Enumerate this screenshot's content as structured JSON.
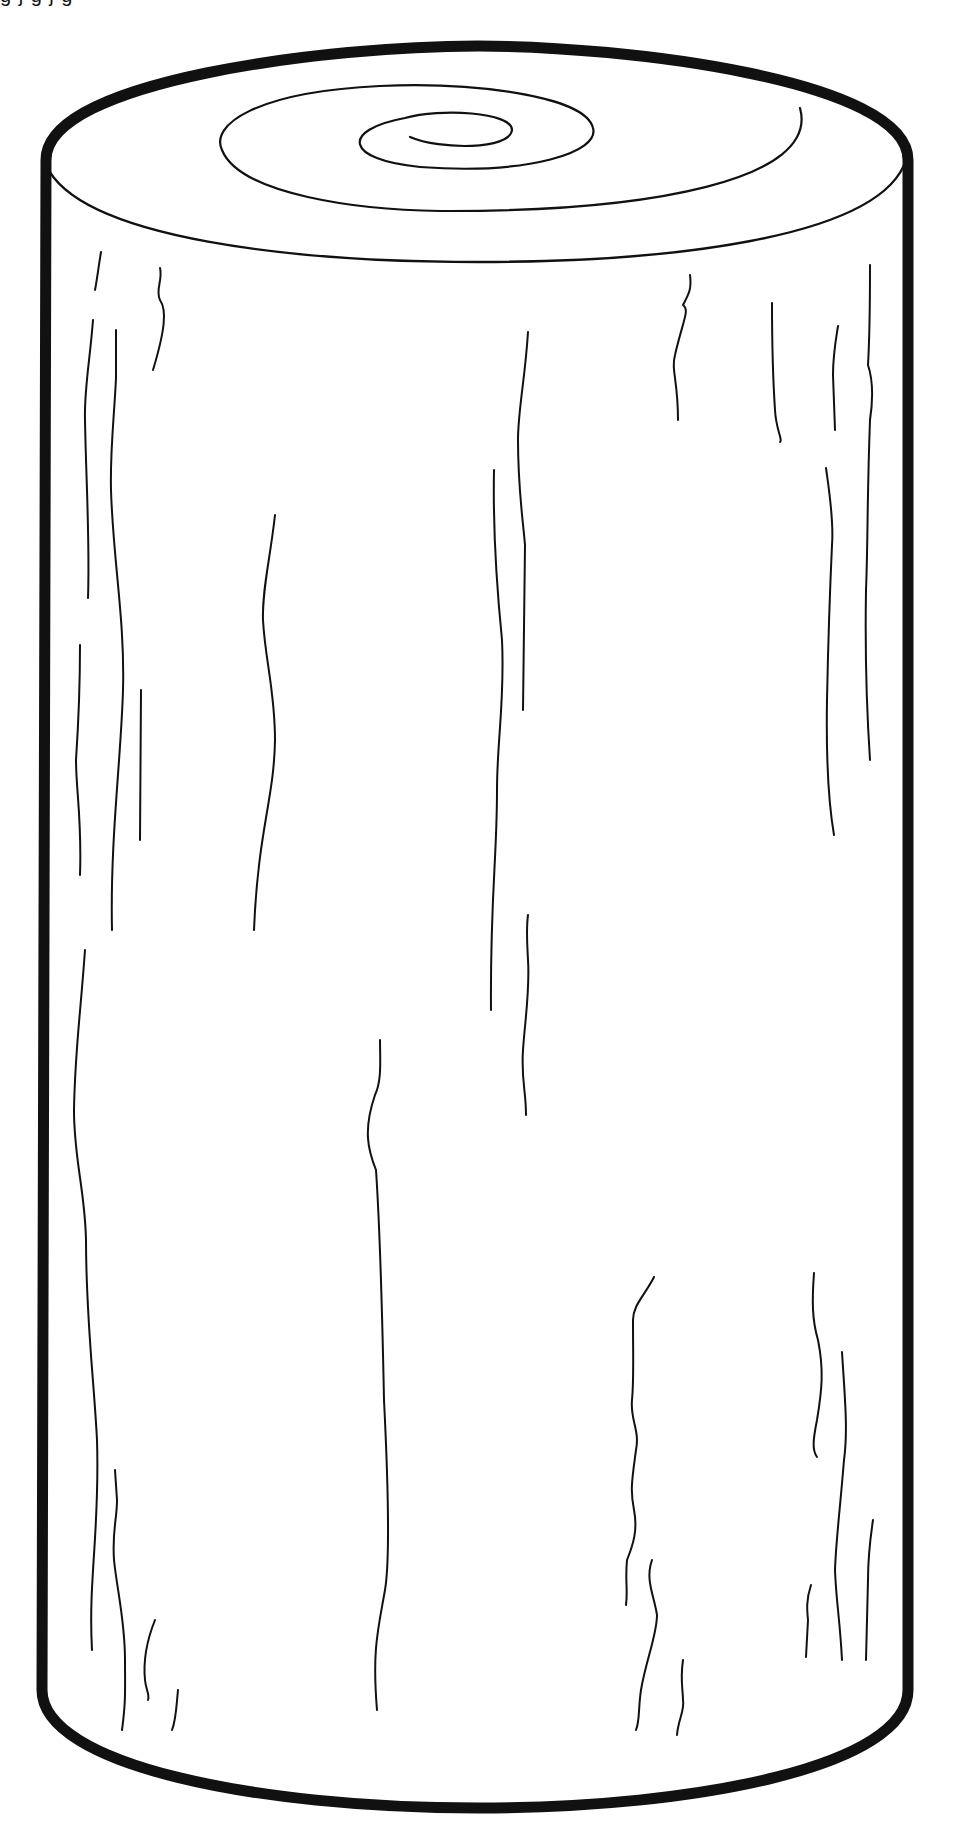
{
  "artwork": {
    "subject": "Wooden log line drawing",
    "cropped_caption": "g    j g     j g",
    "colors": {
      "stroke": "#111111",
      "background": "#ffffff"
    }
  },
  "geometry": {
    "outline": "M 46 160 C 46 80, 330 46, 478 46 C 626 46, 908 80, 908 160 L 908 1690 C 908 1765, 700 1808, 478 1808 C 256 1808, 42 1765, 42 1690 Z",
    "rim": "M 46 165 C 80 240, 300 262, 478 262 C 660 262, 880 240, 906 160",
    "spiral": "M 410 137 C 440 150, 510 150, 512 130 C 512 112, 440 108, 405 118 C 340 130, 345 160, 420 167 C 530 175, 600 152, 593 128 C 585 95, 470 82, 380 86 C 255 92, 210 125, 222 150 C 240 195, 360 210, 440 211 C 650 212, 820 180, 800 108",
    "grains": [
      "M 101 252 C 98 270, 97 280, 95 290",
      "M 93 320 C 90 360, 84 390, 85 420 C 86 480, 90 540, 88 598",
      "M 116 330 L 116 378 C 114 420, 110 450, 111 490 C 113 560, 125 620, 123 690 C 121 760, 110 840, 112 930",
      "M 160 268 C 163 280, 155 290, 160 300 C 167 310, 165 330, 153 370",
      "M 80 645 C 80 690, 78 730, 76 760 C 76 790, 82 820, 80 875",
      "M 141 690 L 140 840",
      "M 275 515 C 270 560, 262 590, 263 620 C 265 660, 275 690, 275 740 C 274 800, 258 830, 254 930",
      "M 85 950 C 80 1020, 75 1050, 74 1110 C 74 1160, 85 1190, 86 1240 C 86 1320, 94 1380, 97 1440 C 100 1530, 88 1580, 92 1650",
      "M 115 1470 L 117 1500 C 117 1520, 112 1530, 114 1560 C 117 1590, 125 1620, 125 1660 C 125 1690, 126 1700, 122 1730",
      "M 155 1620 C 147 1640, 143 1660, 145 1680 C 146 1690, 150 1695, 148 1700",
      "M 178 1690 C 176 1710, 176 1720, 172 1730",
      "M 380 1040 C 380 1060, 382 1080, 375 1095 C 363 1130, 368 1150, 376 1170 C 380 1230, 382 1300, 384 1400 C 388 1480, 390 1560, 385 1590 C 378 1630, 372 1650, 377 1710",
      "M 528 332 C 525 380, 518 410, 518 440 C 518 490, 523 520, 525 545 L 523 710",
      "M 494 470 C 493 520, 496 580, 502 640 C 505 700, 497 740, 497 790 C 497 860, 490 900, 491 1010",
      "M 528 915 C 526 930, 527 940, 528 960 C 530 990, 525 1020, 523 1050 C 521 1080, 526 1090, 526 1115",
      "M 690 275 C 692 290, 688 295, 683 305 C 690 310, 683 320, 675 355 C 671 370, 678 380, 678 420",
      "M 772 303 C 772 350, 773 380, 775 410 C 776 430, 783 440, 780 442",
      "M 838 326 C 835 345, 833 355, 833 375 L 835 430",
      "M 870 265 C 870 300, 870 330, 868 365 C 873 380, 873 400, 870 420 C 867 500, 868 540, 866 590 C 865 650, 866 700, 870 760",
      "M 826 468 C 829 490, 834 520, 832 545 C 829 610, 828 650, 827 700 C 826 760, 828 800, 834 835",
      "M 654 1277 C 645 1295, 633 1305, 633 1320 C 633 1360, 634 1380, 632 1400 C 630 1420, 640 1430, 636 1450 C 632 1480, 630 1490, 634 1510 C 638 1530, 633 1545, 627 1560 C 625 1580, 628 1590, 626 1605",
      "M 652 1560 C 645 1580, 654 1595, 657 1615 C 657 1635, 646 1660, 641 1690 C 638 1710, 640 1720, 636 1730",
      "M 683 1660 C 680 1680, 683 1690, 683 1700 C 685 1710, 678 1720, 677 1735",
      "M 814 1273 C 812 1300, 812 1320, 818 1340 C 824 1370, 822 1390, 817 1420 C 813 1440, 812 1450, 817 1457",
      "M 842 1352 C 845 1400, 848 1430, 844 1460 C 840 1510, 836 1540, 835 1570 C 836 1600, 840 1620, 842 1660",
      "M 811 1585 C 806 1600, 807 1610, 808 1620 L 806 1657",
      "M 873 1520 C 870 1540, 868 1560, 868 1580 L 866 1660"
    ]
  }
}
